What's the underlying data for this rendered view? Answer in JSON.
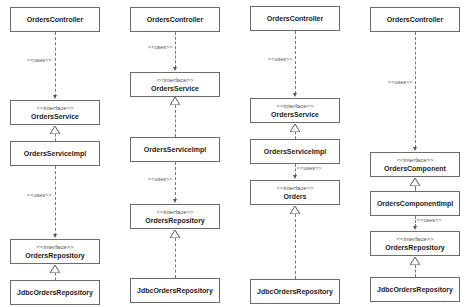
{
  "diagram": {
    "stereotype_interface": "<<interface>>",
    "uses_label": "<<uses>>",
    "columns": [
      {
        "boxes": [
          {
            "name": "OrdersController"
          },
          {
            "stereotype": "<<interface>>",
            "name": "OrdersService"
          },
          {
            "name": "OrdersServiceImpl"
          },
          {
            "stereotype": "<<interface>>",
            "name": "OrdersRepository"
          },
          {
            "name": "JdbcOrdersRepository"
          }
        ],
        "labels": [
          "<<uses>>",
          "<<uses>>"
        ]
      },
      {
        "boxes": [
          {
            "name": "OrdersController"
          },
          {
            "stereotype": "<<interface>>",
            "name": "OrdersService"
          },
          {
            "name": "OrdersServiceImpl"
          },
          {
            "stereotype": "<<interface>>",
            "name": "OrdersRepository"
          },
          {
            "name": "JdbcOrdersRepository"
          }
        ],
        "labels": [
          "<<uses>>",
          "<<uses>>"
        ]
      },
      {
        "boxes": [
          {
            "name": "OrdersController"
          },
          {
            "stereotype": "<<interface>>",
            "name": "OrdersService"
          },
          {
            "name": "OrdersServiceImpl"
          },
          {
            "stereotype": "<<interface>>",
            "name": "Orders"
          },
          {
            "name": "JdbcOrdersRepository"
          }
        ],
        "labels": [
          "<<uses>>",
          "<<uses>>"
        ]
      },
      {
        "boxes": [
          {
            "name": "OrdersController"
          },
          {
            "stereotype": "<<interface>>",
            "name": "OrdersComponent"
          },
          {
            "name": "OrdersComponentImpl"
          },
          {
            "stereotype": "<<interface>>",
            "name": "OrdersRepository"
          },
          {
            "name": "JdbcOrdersRepository"
          }
        ],
        "labels": [
          "<<uses>>",
          "<<uses>>"
        ]
      }
    ]
  }
}
